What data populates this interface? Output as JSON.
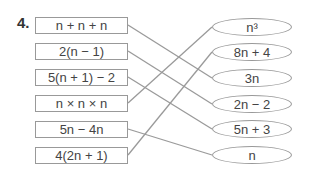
{
  "question_number": "4.",
  "left_expressions": [
    "n + n + n",
    "2(n − 1)",
    "5(n + 1) − 2",
    "n × n × n",
    "5n − 4n",
    "4(2n + 1)"
  ],
  "right_expressions": [
    "n³",
    "8n + 4",
    "3n",
    "2n − 2",
    "5n + 3",
    "n"
  ],
  "matches": [
    [
      0,
      2
    ],
    [
      1,
      3
    ],
    [
      2,
      4
    ],
    [
      3,
      0
    ],
    [
      4,
      5
    ],
    [
      5,
      1
    ]
  ]
}
